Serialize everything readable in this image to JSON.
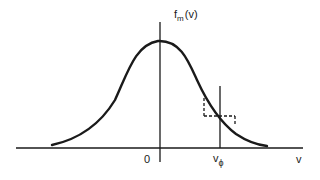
{
  "diagram": {
    "y_axis_label": {
      "main": "f",
      "sub": "m",
      "arg": "(v)"
    },
    "x_axis_label": "v",
    "origin_label": "0",
    "phase_velocity_label": {
      "main": "v",
      "sub": "ϕ"
    },
    "colors": {
      "ink": "#1a1a1a",
      "background": "#ffffff"
    }
  }
}
